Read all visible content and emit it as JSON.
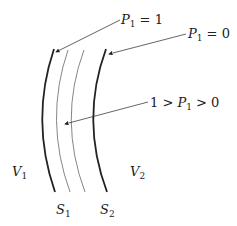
{
  "diagram": {
    "labels": {
      "p1_equals_1": {
        "var": "P",
        "sub": "1",
        "rest": " = 1"
      },
      "p1_equals_0": {
        "var": "P",
        "sub": "1",
        "rest": " = 0"
      },
      "p1_between": {
        "pre": "1 > ",
        "var": "P",
        "sub": "1",
        "rest": " > 0"
      },
      "v1": {
        "var": "V",
        "sub": "1"
      },
      "v2": {
        "var": "V",
        "sub": "2"
      },
      "s1": {
        "var": "S",
        "sub": "1"
      },
      "s2": {
        "var": "S",
        "sub": "2"
      }
    },
    "colors": {
      "line": "#222222",
      "thin_line": "#555555",
      "background": "#ffffff"
    }
  }
}
